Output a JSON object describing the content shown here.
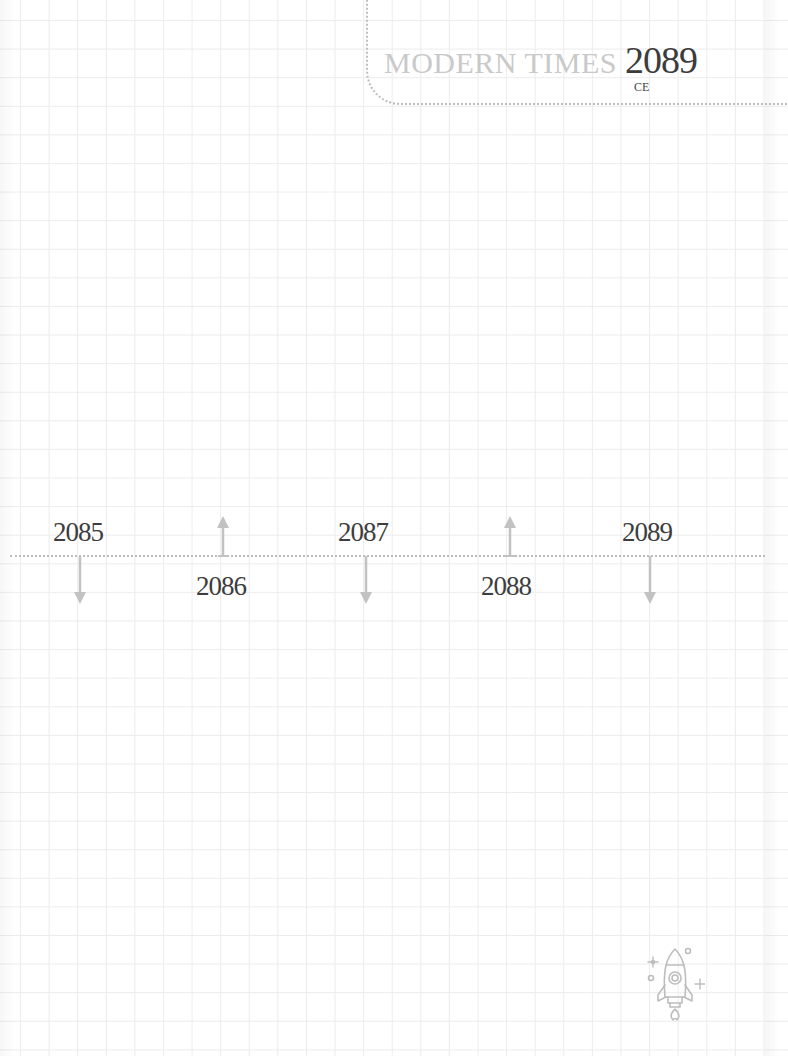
{
  "header": {
    "era": "MODERN TIMES",
    "year": "2089",
    "suffix": "CE"
  },
  "timeline": {
    "entries": [
      {
        "year": "2085",
        "position": "above",
        "arrow": "down"
      },
      {
        "year": "2086",
        "position": "below",
        "arrow": "up"
      },
      {
        "year": "2087",
        "position": "above",
        "arrow": "down"
      },
      {
        "year": "2088",
        "position": "below",
        "arrow": "up"
      },
      {
        "year": "2089",
        "position": "above",
        "arrow": "down"
      }
    ]
  },
  "decoration": {
    "icon": "rocket-icon"
  },
  "colors": {
    "grid": "#ececec",
    "dotted_line": "#bcbcbc",
    "arrow": "#c2c2c2",
    "text_dark": "#3d3d3d",
    "text_light": "#c9c9c9"
  }
}
